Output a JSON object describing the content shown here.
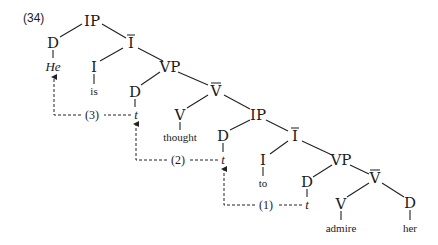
{
  "example_number": "(34)",
  "nodes": {
    "ip_top": "IP",
    "d_he": "D",
    "he": "He",
    "ibar_top": "I",
    "i_is": "I",
    "is": "is",
    "vp_top": "VP",
    "d_t3": "D",
    "t3": "t",
    "vbar_top": "V",
    "v_thought": "V",
    "thought": "thought",
    "ip_mid": "IP",
    "d_t2": "D",
    "t2": "t",
    "ibar_mid": "I",
    "i_to": "I",
    "to": "to",
    "vp_low": "VP",
    "d_t1": "D",
    "t1": "t",
    "vbar_low": "V",
    "v_admire": "V",
    "admire": "admire",
    "d_her": "D",
    "her": "her"
  },
  "movements": [
    {
      "label": "(3)",
      "from": "t3",
      "to": "He"
    },
    {
      "label": "(2)",
      "from": "t2",
      "to": "t3"
    },
    {
      "label": "(1)",
      "from": "t1",
      "to": "t2"
    }
  ]
}
